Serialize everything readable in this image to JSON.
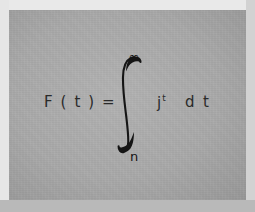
{
  "document": {
    "type": "mathematical-formula",
    "description": "Handwritten-style printed integral equation on gray paper"
  },
  "colors": {
    "paper_background": "#a9a9a9",
    "ink": "#2a2a2a",
    "frame_light": "#e9e9e9",
    "frame_shadow": "#b9b9b9",
    "page_surround": "#d9d9d9"
  },
  "formula": {
    "plain_text": "F(t) = ∫ₙ^∞ jᵗ dt",
    "left_side": "F ( t ) =",
    "integral": {
      "symbol": "integral-sign",
      "upper_limit": "∞",
      "lower_limit": "n"
    },
    "integrand": {
      "base": "j",
      "exponent": "t"
    },
    "differential": "d t"
  }
}
